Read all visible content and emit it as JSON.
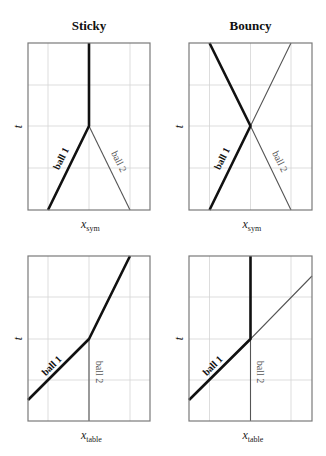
{
  "figure": {
    "panels": [
      {
        "id": "sticky",
        "title": "Sticky",
        "xlabel_main": "x",
        "xlabel_sub": "sym",
        "ylabel": "t",
        "frame": [
          28,
          43,
          150,
          210
        ],
        "gridx": [
          48,
          89,
          130
        ],
        "gridy": [
          85,
          126,
          168
        ],
        "ball1": {
          "label": "ball 1",
          "points": [
            [
              48,
              210
            ],
            [
              89,
              126
            ],
            [
              89,
              43
            ]
          ],
          "label_pos": [
            64,
            160
          ],
          "label_angle": -64
        },
        "ball2": {
          "label": "ball 2",
          "points": [
            [
              130,
              210
            ],
            [
              89,
              126
            ]
          ],
          "label_pos": [
            116,
            163
          ],
          "label_angle": 64
        }
      },
      {
        "id": "bouncy",
        "title": "Bouncy",
        "xlabel_main": "x",
        "xlabel_sub": "sym",
        "ylabel": "t",
        "frame": [
          189,
          43,
          312,
          210
        ],
        "gridx": [
          209.5,
          250.5,
          291
        ],
        "gridy": [
          85,
          126,
          168
        ],
        "ball1": {
          "label": "ball 1",
          "points": [
            [
              209.5,
              210
            ],
            [
              250.5,
              126
            ],
            [
              209.5,
              43
            ]
          ],
          "label_pos": [
            225,
            160
          ],
          "label_angle": -64
        },
        "ball2": {
          "label": "ball 2",
          "points": [
            [
              291,
              210
            ],
            [
              250.5,
              126
            ],
            [
              291,
              43
            ]
          ],
          "label_pos": [
            277,
            163
          ],
          "label_angle": 64
        }
      },
      {
        "id": "sticky-table",
        "title": "",
        "xlabel_main": "x",
        "xlabel_sub": "table",
        "ylabel": "t",
        "frame": [
          28,
          256,
          150,
          421
        ],
        "gridx": [
          48,
          89,
          130
        ],
        "gridy": [
          297,
          339,
          380
        ],
        "ball1": {
          "label": "ball 1",
          "points": [
            [
              28,
              400
            ],
            [
              89,
              339
            ],
            [
              130,
              256
            ]
          ],
          "label_pos": [
            54,
            368
          ],
          "label_angle": -45
        },
        "ball2": {
          "label": "ball 2",
          "points": [
            [
              89,
              339
            ],
            [
              89,
              421
            ]
          ],
          "label_pos": [
            96,
            372
          ],
          "label_angle": 90
        }
      },
      {
        "id": "bouncy-table",
        "title": "",
        "xlabel_main": "x",
        "xlabel_sub": "table",
        "ylabel": "t",
        "frame": [
          189,
          256,
          312,
          421
        ],
        "gridx": [
          209.5,
          250.5,
          291
        ],
        "gridy": [
          297,
          339,
          380
        ],
        "ball1": {
          "label": "ball 1",
          "points": [
            [
              189,
              400
            ],
            [
              250.5,
              339
            ],
            [
              250.5,
              256
            ]
          ],
          "label_pos": [
            215,
            368
          ],
          "label_angle": -45
        },
        "ball2": {
          "label": "ball 2",
          "points": [
            [
              250.5,
              421
            ],
            [
              250.5,
              339
            ],
            [
              312,
              276
            ]
          ],
          "label_pos": [
            257,
            372
          ],
          "label_angle": 90
        }
      }
    ]
  }
}
